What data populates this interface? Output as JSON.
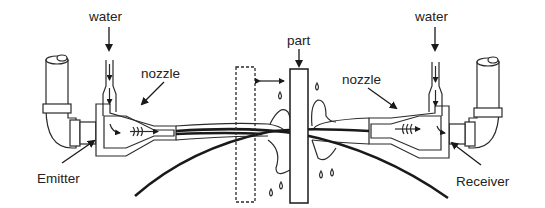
{
  "diagram": {
    "title": "",
    "labels": {
      "water_left": "water",
      "water_right": "water",
      "nozzle_left": "nozzle",
      "nozzle_right": "nozzle",
      "part": "part",
      "emitter": "Emitter",
      "receiver": "Receiver"
    },
    "components": [
      {
        "name": "emitter",
        "side": "left"
      },
      {
        "name": "nozzle",
        "side": "left"
      },
      {
        "name": "part",
        "side": "center"
      },
      {
        "name": "nozzle",
        "side": "right"
      },
      {
        "name": "receiver",
        "side": "right"
      }
    ],
    "colors": {
      "line": "#2a2a2a",
      "background": "#ffffff",
      "emitter_face": "#9a9a9a"
    }
  }
}
